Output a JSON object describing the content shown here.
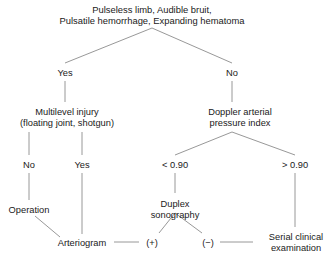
{
  "chart_data": {
    "type": "diagram",
    "diagram_kind": "clinical-decision-tree",
    "background_color": "#ffffff",
    "line_color": "#8c8c8c",
    "text_color": "#1a1a1a",
    "nodes": [
      {
        "id": "root",
        "lines": [
          "Pulseless limb, Audible bruit,",
          "Pulsatile hemorrhage, Expanding hematoma"
        ],
        "x": 152,
        "y": 4
      },
      {
        "id": "yes1",
        "lines": [
          "Yes"
        ],
        "x": 65,
        "y": 68
      },
      {
        "id": "no1",
        "lines": [
          "No"
        ],
        "x": 232,
        "y": 68
      },
      {
        "id": "multilevel",
        "lines": [
          "Multilevel injury",
          "(floating joint, shotgun)"
        ],
        "x": 67,
        "y": 107
      },
      {
        "id": "doppler",
        "lines": [
          "Doppler arterial",
          "pressure index"
        ],
        "x": 240,
        "y": 107
      },
      {
        "id": "no2",
        "lines": [
          "No"
        ],
        "x": 29,
        "y": 160
      },
      {
        "id": "yes2",
        "lines": [
          "Yes"
        ],
        "x": 82,
        "y": 160
      },
      {
        "id": "lt090",
        "lines": [
          "< 0.90"
        ],
        "x": 175,
        "y": 160
      },
      {
        "id": "gt090",
        "lines": [
          "> 0.90"
        ],
        "x": 295,
        "y": 160
      },
      {
        "id": "operation",
        "lines": [
          "Operation"
        ],
        "x": 29,
        "y": 205
      },
      {
        "id": "duplex",
        "lines": [
          "Duplex",
          "sonography"
        ],
        "x": 175,
        "y": 199
      },
      {
        "id": "arteriogram",
        "lines": [
          "Arteriogram"
        ],
        "x": 82,
        "y": 238
      },
      {
        "id": "positive",
        "lines": [
          "(+)"
        ],
        "x": 152,
        "y": 238
      },
      {
        "id": "negative",
        "lines": [
          "(−)"
        ],
        "x": 208,
        "y": 238
      },
      {
        "id": "serial",
        "lines": [
          "Serial clinical",
          "examination"
        ],
        "x": 296,
        "y": 232
      }
    ],
    "edges": [
      {
        "from": "root",
        "to": "yes1",
        "x1": 152,
        "y1": 28,
        "x2": 65,
        "y2": 63
      },
      {
        "from": "root",
        "to": "no1",
        "x1": 152,
        "y1": 28,
        "x2": 232,
        "y2": 63
      },
      {
        "from": "yes1",
        "to": "multilevel",
        "x1": 65,
        "y1": 81,
        "x2": 65,
        "y2": 102
      },
      {
        "from": "no1",
        "to": "doppler",
        "x1": 232,
        "y1": 81,
        "x2": 232,
        "y2": 102
      },
      {
        "from": "multilevel",
        "to": "no2",
        "x1": 29,
        "y1": 132,
        "x2": 29,
        "y2": 155
      },
      {
        "from": "multilevel",
        "to": "yes2",
        "x1": 82,
        "y1": 132,
        "x2": 82,
        "y2": 155
      },
      {
        "from": "doppler",
        "to": "lt090",
        "x1": 232,
        "y1": 132,
        "x2": 175,
        "y2": 155
      },
      {
        "from": "doppler",
        "to": "gt090",
        "x1": 232,
        "y1": 132,
        "x2": 295,
        "y2": 155
      },
      {
        "from": "no2",
        "to": "operation",
        "x1": 29,
        "y1": 173,
        "x2": 29,
        "y2": 200
      },
      {
        "from": "yes2",
        "to": "arteriogram",
        "x1": 82,
        "y1": 173,
        "x2": 82,
        "y2": 234
      },
      {
        "from": "lt090",
        "to": "duplex",
        "x1": 175,
        "y1": 173,
        "x2": 175,
        "y2": 193
      },
      {
        "from": "gt090",
        "to": "serial",
        "x1": 295,
        "y1": 173,
        "x2": 295,
        "y2": 227
      },
      {
        "from": "operation",
        "to": "arteriogram",
        "x1": 35,
        "y1": 216,
        "x2": 60,
        "y2": 237
      },
      {
        "from": "arteriogram",
        "to": "positive",
        "x1": 114,
        "y1": 242,
        "x2": 139,
        "y2": 242
      },
      {
        "from": "positive",
        "to": "duplex",
        "x1": 159,
        "y1": 233,
        "x2": 175,
        "y2": 213
      },
      {
        "from": "duplex",
        "to": "negative",
        "x1": 175,
        "y1": 213,
        "x2": 202,
        "y2": 233
      },
      {
        "from": "negative",
        "to": "serial",
        "x1": 220,
        "y1": 242,
        "x2": 253,
        "y2": 242
      }
    ]
  }
}
